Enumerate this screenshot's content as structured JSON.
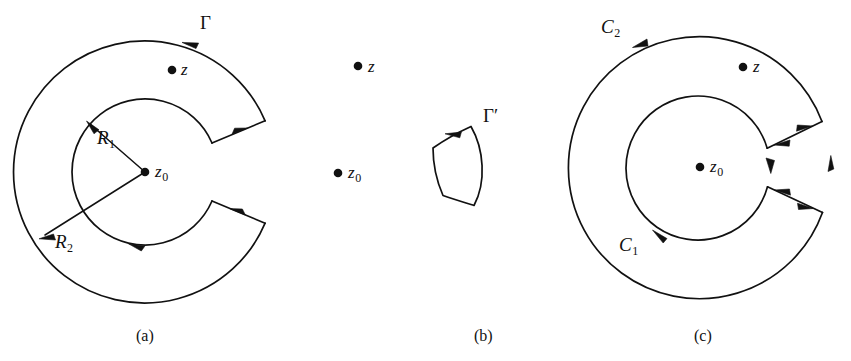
{
  "figure": {
    "background_color": "#ffffff",
    "ink_color": "#111111",
    "panels": [
      {
        "id": "a",
        "caption": "(a)",
        "center_label": "z",
        "center_label_sub": "0",
        "point_label": "z",
        "contour_label": "Γ",
        "radius_inner_label": "R",
        "radius_inner_sub": "1",
        "radius_outer_label": "R",
        "radius_outer_sub": "2",
        "description": "Keyhole contour Gamma: outer circle radius R2 traversed counterclockwise, inner circle radius R1 traversed clockwise, joined by a slit on the right."
      },
      {
        "id": "b",
        "caption": "(b)",
        "center_label": "z",
        "center_label_sub": "0",
        "point_label": "z",
        "contour_label": "Γ",
        "contour_prime": "′",
        "description": "Deformed closed contour Gamma-prime, a curvilinear quadrilateral not enclosing z0 or z."
      },
      {
        "id": "c",
        "caption": "(c)",
        "center_label": "z",
        "center_label_sub": "0",
        "point_label": "z",
        "outer_circle_label": "C",
        "outer_circle_sub": "2",
        "inner_circle_label": "C",
        "inner_circle_sub": "1",
        "description": "Annulus bounded by C1 (inner, clockwise) and C2 (outer, counterclockwise) with cross-cut arrows on the right."
      }
    ]
  }
}
